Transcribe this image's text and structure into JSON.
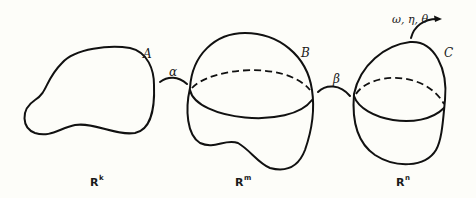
{
  "diagram": {
    "shapes": [
      {
        "id": "A",
        "label": "A",
        "space": "R",
        "space_exp": "k"
      },
      {
        "id": "B",
        "label": "B",
        "space": "R",
        "space_exp": "m"
      },
      {
        "id": "C",
        "label": "C",
        "space": "R",
        "space_exp": "n"
      }
    ],
    "maps": [
      {
        "from": "A",
        "to": "B",
        "label": "α"
      },
      {
        "from": "B",
        "to": "C",
        "label": "β"
      }
    ],
    "forms_label": "ω, η, θ"
  },
  "colors": {
    "stroke": "#111111",
    "background": "#fdfdf9"
  }
}
